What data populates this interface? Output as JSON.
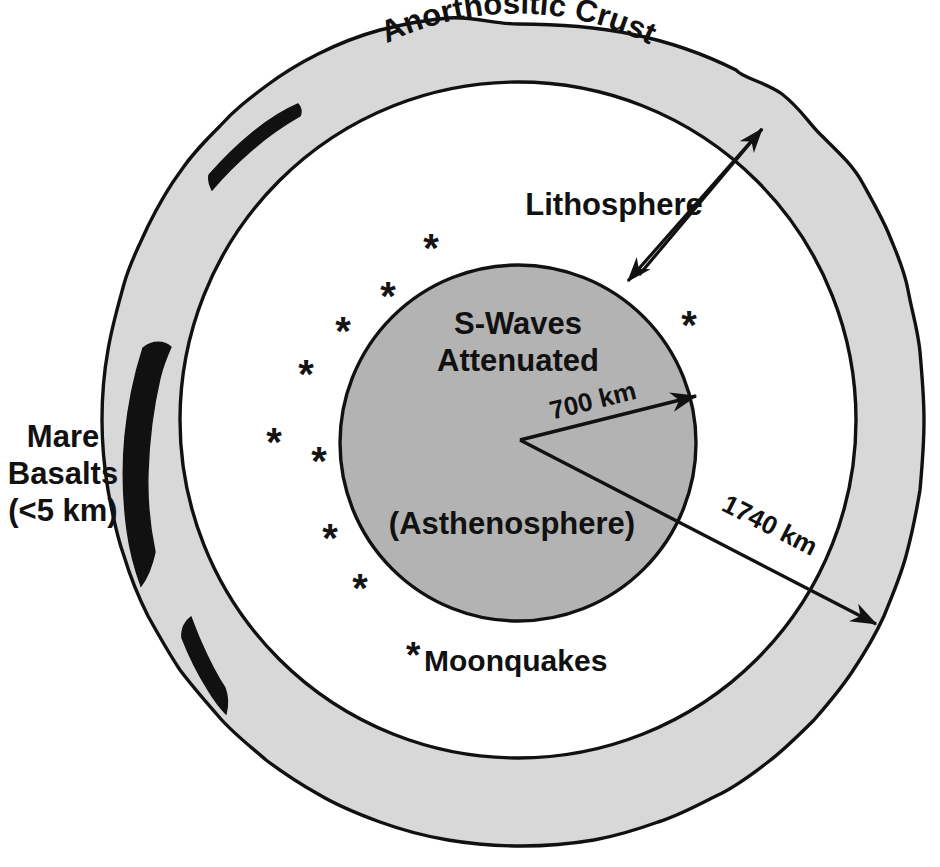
{
  "figure": {
    "kind": "lunar-interior-cross-section",
    "background_color": "#ffffff",
    "line_color": "#111111",
    "crust_fill": "#d8d8d8",
    "asthenosphere_fill": "#b3b3b3",
    "mare_basalt_fill": "#111111"
  },
  "labels": {
    "crust": "Anorthositic Crust",
    "lithosphere": "Lithosphere",
    "swaves_line1": "S-Waves",
    "swaves_line2": "Attenuated",
    "asthenosphere": "(Asthenosphere)",
    "mare_line1": "Mare",
    "mare_line2": "Basalts",
    "mare_line3": "(<5 km)",
    "radius_inner": "700 km",
    "radius_outer": "1740 km",
    "moonquakes_star": "*",
    "moonquakes": "Moonquakes"
  },
  "measurements": {
    "asthenosphere_radius_km": 700,
    "moon_radius_km": 1740,
    "mare_basalt_thickness_km": "<5"
  },
  "moonquake_markers": [
    {
      "x": 431,
      "y": 262
    },
    {
      "x": 388,
      "y": 310
    },
    {
      "x": 343,
      "y": 345
    },
    {
      "x": 306,
      "y": 388
    },
    {
      "x": 274,
      "y": 456
    },
    {
      "x": 319,
      "y": 475
    },
    {
      "x": 330,
      "y": 552
    },
    {
      "x": 360,
      "y": 602
    },
    {
      "x": 689,
      "y": 339
    }
  ]
}
